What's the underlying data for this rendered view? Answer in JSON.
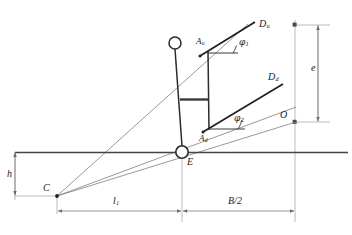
{
  "figure": {
    "type": "technical-line-diagram",
    "background_color": "#ffffff",
    "stroke_color": "#1a1a1a",
    "thin_stroke_color": "#5a5a5a",
    "dimension_color": "#6b6b6b"
  },
  "labels": {
    "d_upper": {
      "base": "D",
      "sub": "u"
    },
    "d_lower": {
      "base": "D",
      "sub": "d"
    },
    "a_upper": {
      "base": "A",
      "sub": "u"
    },
    "a_lower": {
      "base": "A",
      "sub": "d"
    },
    "phi1": {
      "base": "φ",
      "sub": "1"
    },
    "phi2": {
      "base": "φ",
      "sub": "2"
    },
    "point_c": {
      "base": "C",
      "sub": ""
    },
    "point_e": {
      "base": "E",
      "sub": ""
    },
    "point_o": {
      "base": "O",
      "sub": ""
    },
    "height_h": {
      "base": "h",
      "sub": ""
    },
    "eccentricity_e": {
      "base": "e",
      "sub": ""
    },
    "length_l1": {
      "base": "l",
      "sub": "1"
    },
    "half_beam": {
      "base": "B/2",
      "sub": ""
    }
  }
}
